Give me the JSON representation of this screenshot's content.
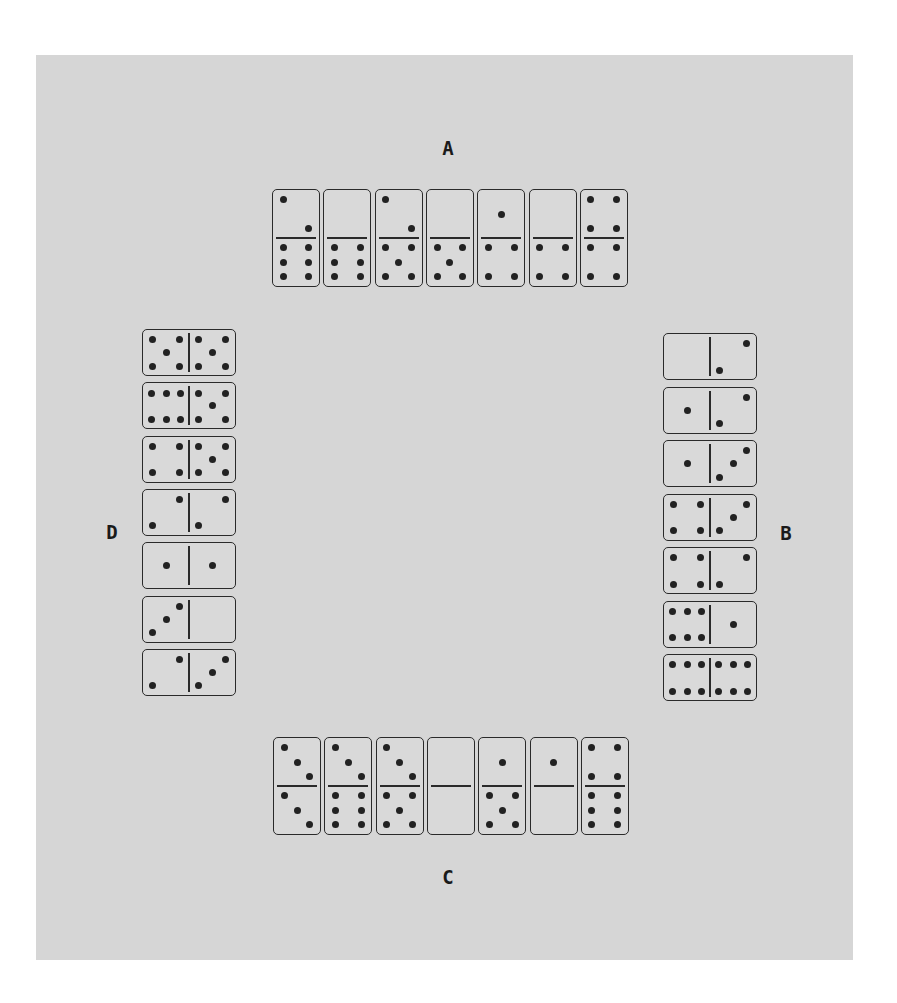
{
  "players": [
    {
      "id": "A",
      "label": "A",
      "side": "top",
      "dominoes": [
        [
          2,
          6
        ],
        [
          0,
          6
        ],
        [
          2,
          5
        ],
        [
          0,
          5
        ],
        [
          1,
          4
        ],
        [
          0,
          4
        ],
        [
          4,
          4
        ]
      ]
    },
    {
      "id": "B",
      "label": "B",
      "side": "right",
      "dominoes": [
        [
          0,
          2
        ],
        [
          1,
          2
        ],
        [
          1,
          3
        ],
        [
          4,
          3
        ],
        [
          4,
          2
        ],
        [
          6,
          1
        ],
        [
          6,
          6
        ]
      ]
    },
    {
      "id": "C",
      "label": "C",
      "side": "bottom",
      "dominoes": [
        [
          3,
          3
        ],
        [
          3,
          6
        ],
        [
          3,
          5
        ],
        [
          0,
          0
        ],
        [
          1,
          5
        ],
        [
          1,
          0
        ],
        [
          4,
          6
        ]
      ]
    },
    {
      "id": "D",
      "label": "D",
      "side": "left",
      "dominoes": [
        [
          5,
          5
        ],
        [
          6,
          5
        ],
        [
          4,
          5
        ],
        [
          2,
          2
        ],
        [
          1,
          1
        ],
        [
          3,
          0
        ],
        [
          2,
          3
        ]
      ]
    }
  ],
  "colors": {
    "table": "#d6d6d6",
    "domino_face": "#d9d9d9",
    "ink": "#222222"
  }
}
